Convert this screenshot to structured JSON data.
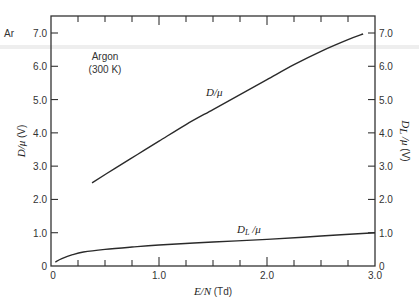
{
  "chart_data": {
    "type": "line",
    "title": "",
    "corner_label": "Ar",
    "annotation": {
      "line1": "Argon",
      "line2": "(300 K)"
    },
    "xlabel": "E/N (Td)",
    "ylabel_left": "D/μ (V)",
    "ylabel_right": "D_L/μ (V)",
    "xlim": [
      0,
      3.0
    ],
    "ylim": [
      0,
      7.0
    ],
    "grid": false,
    "legend": "none (inline curve labels)",
    "x_ticks": [
      "0",
      "1.0",
      "2.0",
      "3.0"
    ],
    "y_ticks_left": [
      "0",
      "1.0",
      "2.0",
      "3.0",
      "4.0",
      "5.0",
      "6.0",
      "7.0"
    ],
    "y_ticks_right": [
      "0",
      "1.0",
      "2.0",
      "3.0",
      "4.0",
      "5.0",
      "6.0",
      "7.0"
    ],
    "series": [
      {
        "name": "D/μ",
        "axis": "left",
        "x": [
          0.38,
          0.6,
          0.8,
          1.0,
          1.25,
          1.5,
          1.75,
          2.0,
          2.25,
          2.5,
          2.75,
          2.89
        ],
        "values": [
          2.5,
          2.95,
          3.35,
          3.75,
          4.25,
          4.7,
          5.15,
          5.6,
          6.05,
          6.45,
          6.8,
          6.97
        ]
      },
      {
        "name": "D_L/μ",
        "axis": "right",
        "x": [
          0.04,
          0.1,
          0.2,
          0.3,
          0.5,
          0.75,
          1.0,
          1.5,
          2.0,
          2.5,
          3.0
        ],
        "values": [
          0.12,
          0.22,
          0.34,
          0.42,
          0.5,
          0.57,
          0.63,
          0.72,
          0.8,
          0.9,
          1.0
        ]
      }
    ]
  },
  "labels": {
    "corner": "Ar",
    "annotation_line1": "Argon",
    "annotation_line2": "(300 K)",
    "series1_label": "D/μ",
    "series2_label_main": "D",
    "series2_label_sub": "L",
    "series2_label_tail": " /μ",
    "xlabel_main": "E/N",
    "xlabel_unit": " (Td)",
    "ylabel_left_main": "D/μ",
    "ylabel_left_unit": " (V)",
    "ylabel_right_main": "D",
    "ylabel_right_sub": "L",
    "ylabel_right_tail": " /μ",
    "ylabel_right_unit": " (V)"
  }
}
